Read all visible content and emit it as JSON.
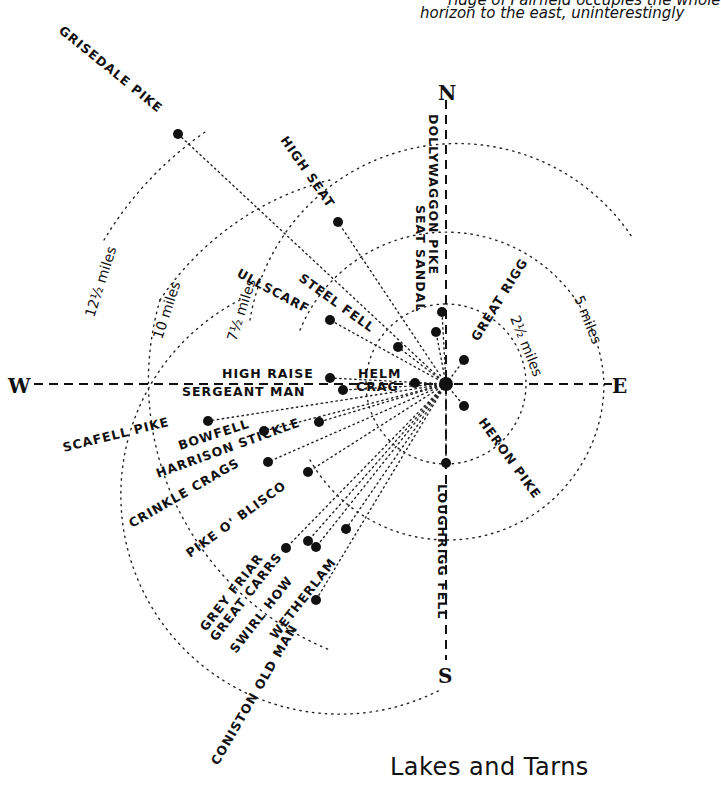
{
  "intro_text": [
    "ridge of Fairfield occupies the whole",
    "horizon to the east, uninterestingly"
  ],
  "section_title": "Lakes and Tarns",
  "section_subtitle": "...",
  "center": {
    "x": 446,
    "y": 384
  },
  "compass": [
    {
      "name": "N",
      "label": "N",
      "x": 446,
      "y": 93
    },
    {
      "name": "E",
      "label": "E",
      "x": 622,
      "y": 392
    },
    {
      "name": "S",
      "label": "S",
      "x": 446,
      "y": 682
    },
    {
      "name": "W",
      "label": "W",
      "x": 18,
      "y": 392
    }
  ],
  "distance_rings": [
    {
      "label": "2½ miles",
      "radius_px": 80
    },
    {
      "label": "5 miles",
      "radius_px": 158
    },
    {
      "label": "7½ miles",
      "radius_px": 210
    },
    {
      "label": "10 miles",
      "radius_px": 290
    },
    {
      "label": "12½ miles",
      "radius_px": 350
    }
  ],
  "summits": [
    {
      "name": "Grisedale Pike",
      "label": "GRISEDALE PIKE",
      "x": 178,
      "y": 134
    },
    {
      "name": "High Seat",
      "label": "HIGH SEAT",
      "x": 338,
      "y": 222
    },
    {
      "name": "Dollywaggon Pike",
      "label": "DOLLYWAGGON PIKE",
      "x": 442,
      "y": 312
    },
    {
      "name": "Seat Sandal",
      "label": "SEAT SANDAL",
      "x": 436,
      "y": 332
    },
    {
      "name": "Great Rigg",
      "label": "GREAT RIGG",
      "x": 464,
      "y": 360
    },
    {
      "name": "Ullscarf",
      "label": "ULLSCARF",
      "x": 330,
      "y": 320
    },
    {
      "name": "Steel Fell",
      "label": "STEEL FELL",
      "x": 398,
      "y": 347
    },
    {
      "name": "High Raise",
      "label": "HIGH RAISE",
      "x": 330,
      "y": 378
    },
    {
      "name": "Sergeant Man",
      "label": "SERGEANT MAN",
      "x": 343,
      "y": 390
    },
    {
      "name": "Helm Crag",
      "label": "HELM CRAG",
      "x": 415,
      "y": 383
    },
    {
      "name": "Scafell Pike",
      "label": "SCAFELL PIKE",
      "x": 208,
      "y": 421
    },
    {
      "name": "Bowfell",
      "label": "BOWFELL",
      "x": 264,
      "y": 431
    },
    {
      "name": "Harrison Stickle",
      "label": "HARRISON STICKLE",
      "x": 319,
      "y": 422
    },
    {
      "name": "Crinkle Crags",
      "label": "CRINKLE CRAGS",
      "x": 268,
      "y": 462
    },
    {
      "name": "Pike o' Blisco",
      "label": "PIKE O' BLISCO",
      "x": 308,
      "y": 472
    },
    {
      "name": "Grey Friar",
      "label": "GREY FRIAR",
      "x": 286,
      "y": 548
    },
    {
      "name": "Great Carrs",
      "label": "GREAT CARRS",
      "x": 308,
      "y": 541
    },
    {
      "name": "Swirl How",
      "label": "SWIRL HOW",
      "x": 316,
      "y": 547
    },
    {
      "name": "Wetherlam",
      "label": "WETHERLAM",
      "x": 346,
      "y": 529
    },
    {
      "name": "Coniston Old Man",
      "label": "CONISTON OLD MAN",
      "x": 316,
      "y": 600
    },
    {
      "name": "Heron Pike",
      "label": "HERON PIKE",
      "x": 464,
      "y": 406
    },
    {
      "name": "Loughrigg Fell",
      "label": "LOUGHRIGG FELL",
      "x": 446,
      "y": 463
    }
  ]
}
